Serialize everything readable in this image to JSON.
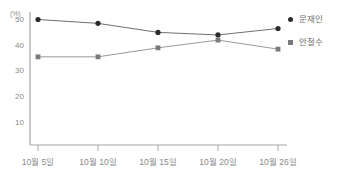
{
  "chart_data": {
    "type": "line",
    "title": "",
    "xlabel": "",
    "ylabel": "(%)",
    "unit_label": "(%)",
    "categories": [
      "10월 5일",
      "10월 10일",
      "10월 15일",
      "10월 20일",
      "10월 26일"
    ],
    "yticks": [
      50,
      40,
      30,
      20,
      10
    ],
    "ylim": [
      0,
      55
    ],
    "grid": false,
    "legend_position": "right",
    "series": [
      {
        "name": "문재인",
        "marker": "circle",
        "color": "#2b2b2b",
        "line_color": "#707070",
        "values": [
          50,
          48.5,
          45,
          44,
          46.5
        ]
      },
      {
        "name": "안철수",
        "marker": "square",
        "color": "#7a7a7a",
        "line_color": "#9a9a9a",
        "values": [
          35.5,
          35.5,
          39,
          42,
          38.5
        ]
      }
    ]
  },
  "axis": {
    "y_tick_labels": [
      "50",
      "40",
      "30",
      "20",
      "10"
    ],
    "x_tick_labels": [
      "10월 5일",
      "10월 10일",
      "10월 15일",
      "10월 20일",
      "10월 26일"
    ],
    "unit": "(%)"
  },
  "legend": {
    "items": [
      {
        "label": "문재인",
        "marker": "circle-marker-icon",
        "color": "#2b2b2b"
      },
      {
        "label": "안철수",
        "marker": "square-marker-icon",
        "color": "#7a7a7a"
      }
    ]
  },
  "colors": {
    "axis": "#9a9a9a",
    "text": "#8a8a8a",
    "series1": "#2b2b2b",
    "series2": "#7a7a7a",
    "background": "#ffffff"
  }
}
